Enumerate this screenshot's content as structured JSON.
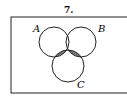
{
  "problem_number": "7.",
  "diagram": {
    "type": "venn-3-set",
    "universe_rect": {
      "x": 11,
      "y": 17,
      "w": 120,
      "h": 76
    },
    "sets": [
      {
        "label": "A",
        "cx": 54,
        "cy": 42,
        "r": 15
      },
      {
        "label": "B",
        "cx": 81,
        "cy": 42,
        "r": 15
      },
      {
        "label": "C",
        "cx": 68,
        "cy": 66,
        "r": 16
      }
    ],
    "shaded_regions": [
      "(A∩C)−B",
      "(B∩C)−A"
    ],
    "stroke_color": "#222222",
    "shade_color": "#555555"
  }
}
